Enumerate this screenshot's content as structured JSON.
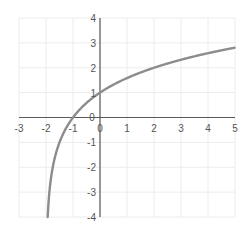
{
  "chart_data": {
    "type": "line",
    "title": "",
    "xlabel": "",
    "ylabel": "",
    "function": "y = log2(x + 2)",
    "xlim": [
      -3,
      5
    ],
    "ylim": [
      -4,
      4
    ],
    "grid": true,
    "legend": null,
    "x_ticks": [
      "-3",
      "-2",
      "-1",
      "0",
      "1",
      "2",
      "3",
      "4",
      "5"
    ],
    "y_ticks": [
      "4",
      "3",
      "2",
      "1",
      "0",
      "-1",
      "-2",
      "-3",
      "-4"
    ],
    "series": [
      {
        "name": "log2(x+2)",
        "color": "#8c8c8c",
        "x": [
          -1.9375,
          -1.875,
          -1.75,
          -1.5,
          -1.25,
          -1,
          -0.5,
          0,
          0.5,
          1,
          1.5,
          2,
          2.5,
          3,
          3.5,
          4,
          4.5,
          5
        ],
        "y": [
          -4,
          -3,
          -2,
          -1,
          -0.415,
          0,
          0.585,
          1,
          1.322,
          1.585,
          1.807,
          2,
          2.17,
          2.322,
          2.459,
          2.585,
          2.7,
          2.807
        ]
      }
    ]
  },
  "colors": {
    "grid": "#ececec",
    "axis": "#595959",
    "curve": "#8c8c8c",
    "tick_label": "#555555"
  }
}
